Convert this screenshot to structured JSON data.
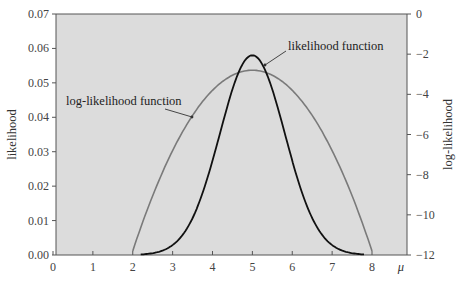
{
  "chart_data": {
    "type": "line",
    "title": "",
    "xlabel": "μ",
    "ylabel": "likelihood",
    "y2label": "log-likelihood",
    "xlim": [
      0,
      8
    ],
    "ylim": [
      0,
      0.07
    ],
    "y2lim": [
      -12,
      0
    ],
    "x_ticks": [
      "0",
      "1",
      "2",
      "3",
      "4",
      "5",
      "6",
      "7",
      "8"
    ],
    "y_ticks": [
      "0.00",
      "0.01",
      "0.02",
      "0.03",
      "0.04",
      "0.05",
      "0.06",
      "0.07"
    ],
    "y2_ticks": [
      "0",
      "−2",
      "−4",
      "−6",
      "−8",
      "−10",
      "−12"
    ],
    "grid": false,
    "background": "#dcdcdc",
    "series": [
      {
        "name": "likelihood function",
        "axis": "left",
        "color": "#111111",
        "x": [
          2.5,
          3.0,
          3.5,
          4.0,
          4.25,
          4.5,
          4.75,
          5.0,
          5.25,
          5.5,
          5.75,
          6.0,
          6.5,
          7.0,
          7.5
        ],
        "values": [
          0.0005,
          0.0029,
          0.0107,
          0.0274,
          0.0381,
          0.0481,
          0.0553,
          0.058,
          0.0553,
          0.0481,
          0.0381,
          0.0274,
          0.0107,
          0.0029,
          0.0005
        ]
      },
      {
        "name": "log-likelihood function",
        "axis": "right",
        "color": "#7a7a7a",
        "x": [
          2,
          2.5,
          3,
          3.5,
          4,
          4.5,
          5,
          5.5,
          6,
          6.5,
          7,
          7.5,
          8
        ],
        "values": [
          -11.8,
          -9.05,
          -6.8,
          -5.05,
          -3.8,
          -3.05,
          -2.8,
          -3.05,
          -3.8,
          -5.05,
          -6.8,
          -9.05,
          -11.8
        ]
      }
    ],
    "annotations": [
      {
        "text": "likelihood function",
        "points_to": "likelihood peak"
      },
      {
        "text": "log-likelihood function",
        "points_to": "log-likelihood curve"
      }
    ]
  }
}
